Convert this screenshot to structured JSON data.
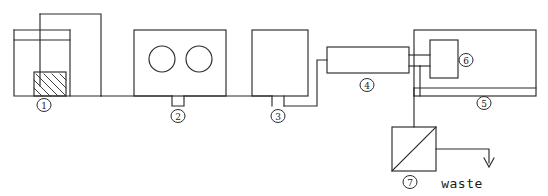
{
  "diagram": {
    "stroke_color": "#2b2b2b",
    "background_color": "#ffffff",
    "waste_label": "waste",
    "callouts": [
      {
        "id": "1",
        "label": "1",
        "component": "sample-vessel",
        "x": 44,
        "y": 105
      },
      {
        "id": "2",
        "label": "2",
        "component": "peristaltic-pump",
        "x": 178,
        "y": 116
      },
      {
        "id": "3",
        "label": "3",
        "component": "injection-valve",
        "x": 278,
        "y": 116
      },
      {
        "id": "4",
        "label": "4",
        "component": "reaction-coil",
        "x": 367,
        "y": 85
      },
      {
        "id": "5",
        "label": "5",
        "component": "detector-housing",
        "x": 484,
        "y": 103
      },
      {
        "id": "6",
        "label": "6",
        "component": "flow-cell",
        "x": 466,
        "y": 60
      },
      {
        "id": "7",
        "label": "7",
        "component": "waste-separator",
        "x": 410,
        "y": 182
      }
    ],
    "components": {
      "vessel": {
        "name": "sample-vessel",
        "x": 14,
        "y": 30,
        "width": 56,
        "height": 66,
        "rim_y": 40,
        "hatch_block": {
          "x": 34,
          "y": 72,
          "width": 32,
          "height": 24
        },
        "probe_x": 40,
        "probe_top": 14
      },
      "pump": {
        "name": "peristaltic-pump",
        "x": 134,
        "y": 30,
        "width": 92,
        "height": 66,
        "rollers": [
          {
            "cx": 162,
            "cy": 59,
            "r": 13
          },
          {
            "cx": 199,
            "cy": 59,
            "r": 13
          }
        ],
        "notch": {
          "x": 172,
          "y": 96,
          "width": 12,
          "height": 10
        }
      },
      "valve": {
        "name": "injection-valve",
        "x": 252,
        "y": 30,
        "width": 56,
        "height": 66,
        "stub_left_x": 272,
        "stub_right_x": 284,
        "stub_bottom": 106
      },
      "coil": {
        "name": "reaction-coil",
        "x": 327,
        "y": 47,
        "width": 82,
        "height": 26
      },
      "housing": {
        "name": "detector-housing",
        "x": 414,
        "y": 30,
        "width": 122,
        "height": 66
      },
      "cell": {
        "name": "flow-cell",
        "x": 430,
        "y": 40,
        "width": 28,
        "height": 38
      },
      "separator": {
        "name": "waste-separator",
        "x": 392,
        "y": 127,
        "width": 44,
        "height": 44
      }
    },
    "waste_arrow": {
      "start_x": 436,
      "start_y": 149,
      "corner_x": 489,
      "end_y": 166,
      "text_x": 462,
      "text_y": 188
    }
  }
}
